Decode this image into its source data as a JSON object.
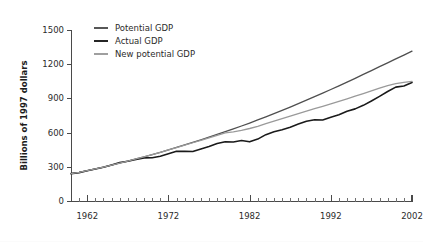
{
  "chart_data": {
    "type": "line",
    "title": "",
    "subtitle": "",
    "xlabel": "",
    "ylabel": "Billions of 1997 dollars",
    "xlim": [
      1960,
      2002
    ],
    "ylim": [
      0,
      1500
    ],
    "y_ticks": [
      0,
      300,
      600,
      900,
      1200,
      1500
    ],
    "x_ticks_major": [
      1962,
      1972,
      1982,
      1992,
      2002
    ],
    "x_tick_labels": [
      "1962",
      "1972",
      "1982",
      "1992",
      "2002"
    ],
    "y_tick_labels": [
      "0",
      "300",
      "600",
      "900",
      "1200",
      "1500"
    ],
    "x_minor_tick_interval": 1,
    "grid": false,
    "legend_position": "top-left-inside",
    "x": [
      1960,
      1961,
      1962,
      1963,
      1964,
      1965,
      1966,
      1967,
      1968,
      1969,
      1970,
      1971,
      1972,
      1973,
      1974,
      1975,
      1976,
      1977,
      1978,
      1979,
      1980,
      1981,
      1982,
      1983,
      1984,
      1985,
      1986,
      1987,
      1988,
      1989,
      1990,
      1991,
      1992,
      1993,
      1994,
      1995,
      1996,
      1997,
      1998,
      1999,
      2000,
      2001,
      2002
    ],
    "series": [
      {
        "name": "Potential GDP",
        "color": "#4f4f4f",
        "width": 1.3,
        "values": [
          240,
          252,
          266,
          281,
          297,
          314,
          332,
          350,
          369,
          388,
          407,
          427,
          448,
          470,
          492,
          514,
          537,
          560,
          584,
          608,
          633,
          658,
          684,
          711,
          738,
          766,
          795,
          824,
          854,
          884,
          915,
          946,
          978,
          1010,
          1043,
          1076,
          1110,
          1144,
          1178,
          1212,
          1246,
          1280,
          1314
        ]
      },
      {
        "name": "Actual GDP",
        "color": "#1a1a1a",
        "width": 1.6,
        "values": [
          240,
          249,
          265,
          280,
          296,
          316,
          337,
          348,
          364,
          378,
          379,
          392,
          414,
          437,
          435,
          434,
          457,
          478,
          504,
          520,
          518,
          531,
          519,
          543,
          582,
          607,
          625,
          647,
          675,
          700,
          713,
          710,
          735,
          756,
          787,
          808,
          839,
          877,
          918,
          960,
          999,
          1009,
          1040
        ]
      },
      {
        "name": "New potential GDP",
        "color": "#9a9a9a",
        "width": 1.3,
        "values": [
          240,
          252,
          266,
          281,
          297,
          314,
          332,
          350,
          369,
          388,
          407,
          427,
          448,
          469,
          490,
          511,
          532,
          554,
          576,
          598,
          607,
          620,
          636,
          655,
          678,
          700,
          722,
          744,
          766,
          788,
          810,
          831,
          852,
          874,
          896,
          919,
          942,
          966,
          990,
          1012,
          1030,
          1041,
          1050
        ]
      }
    ],
    "legend_entries": [
      {
        "label": "Potential GDP",
        "color": "#4f4f4f"
      },
      {
        "label": "Actual GDP",
        "color": "#1a1a1a"
      },
      {
        "label": "New potential GDP",
        "color": "#9a9a9a"
      }
    ]
  }
}
